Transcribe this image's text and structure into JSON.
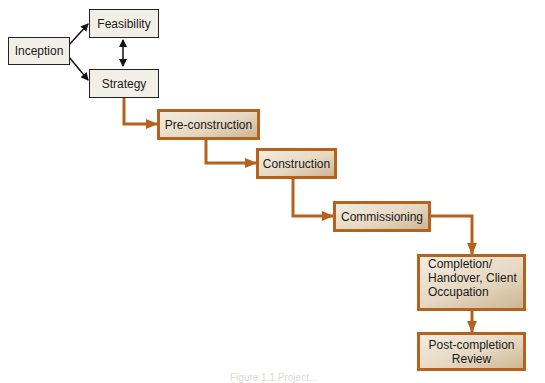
{
  "diagram": {
    "type": "process-flow",
    "colors": {
      "connector": "#b5621f",
      "black_arrow": "#111111",
      "plain_box_bg": "#f2efe6",
      "stage_border": "#b5621f"
    },
    "nodes": {
      "inception": {
        "label": "Inception"
      },
      "feasibility": {
        "label": "Feasibility"
      },
      "strategy": {
        "label": "Strategy"
      },
      "preconstruction": {
        "label": "Pre-construction"
      },
      "construction": {
        "label": "Construction"
      },
      "commissioning": {
        "label": "Commissioning"
      },
      "completion": {
        "label_lines": [
          "Completion/",
          "Handover, Client",
          "Occupation"
        ]
      },
      "postcompletion": {
        "label_lines": [
          "Post-completion",
          "Review"
        ]
      }
    },
    "edges": [
      {
        "from": "Inception",
        "to": "Feasibility"
      },
      {
        "from": "Inception",
        "to": "Strategy"
      },
      {
        "from": "Feasibility",
        "to": "Strategy",
        "bidirectional": true
      },
      {
        "from": "Strategy",
        "to": "Pre-construction"
      },
      {
        "from": "Pre-construction",
        "to": "Construction"
      },
      {
        "from": "Construction",
        "to": "Commissioning"
      },
      {
        "from": "Commissioning",
        "to": "Completion/Handover, Client Occupation"
      },
      {
        "from": "Completion/Handover, Client Occupation",
        "to": "Post-completion Review"
      }
    ],
    "caption": "Figure 1.1 Project..."
  }
}
